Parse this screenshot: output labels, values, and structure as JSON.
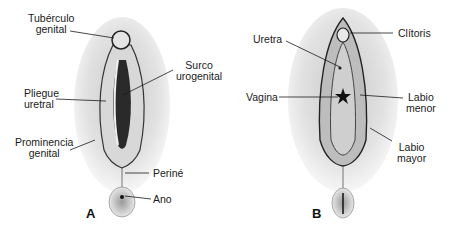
{
  "panels": [
    {
      "letter": "A",
      "labels": {
        "tuberculo": [
          "Tubérculo",
          "genital"
        ],
        "surco": [
          "Surco",
          "urogenital"
        ],
        "pliegue": [
          "Pliegue",
          "uretral"
        ],
        "prominencia": [
          "Prominencia",
          "genital"
        ],
        "perine": "Periné",
        "ano": "Ano"
      }
    },
    {
      "letter": "B",
      "labels": {
        "uretra": "Uretra",
        "clitoris": "Clítoris",
        "vagina": "Vagina",
        "labio_menor": [
          "Labio",
          "menor"
        ],
        "labio_mayor": [
          "Labio",
          "mayor"
        ]
      }
    }
  ],
  "colors": {
    "ink": "#1a1a1a",
    "shade": "#cfcfcf",
    "background": "#ffffff"
  }
}
